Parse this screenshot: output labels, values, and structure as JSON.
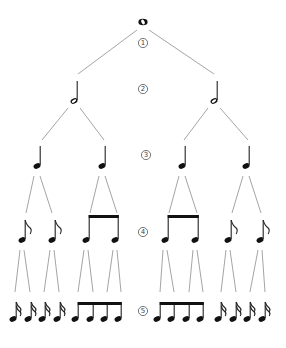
{
  "diagram": {
    "colors": {
      "branch": "#9a9a9a",
      "note": "#111111",
      "label": "#444444"
    },
    "level_labels": [
      {
        "text": "1",
        "x": 143,
        "y": 43
      },
      {
        "text": "2",
        "x": 143,
        "y": 89
      },
      {
        "text": "3",
        "x": 146,
        "y": 155
      },
      {
        "text": "4",
        "x": 143,
        "y": 232
      },
      {
        "text": "5",
        "x": 143,
        "y": 311
      }
    ],
    "levels": [
      {
        "level": 1,
        "name": "whole note",
        "notes": [
          {
            "type": "whole",
            "x": 143,
            "y": 22
          }
        ]
      },
      {
        "level": 2,
        "name": "half notes",
        "notes": [
          {
            "type": "half",
            "x": 74,
            "y": 101
          },
          {
            "type": "half",
            "x": 214,
            "y": 101
          }
        ]
      },
      {
        "level": 3,
        "name": "quarter notes",
        "notes": [
          {
            "type": "quarter",
            "x": 37,
            "y": 166
          },
          {
            "type": "quarter",
            "x": 102,
            "y": 166
          },
          {
            "type": "quarter",
            "x": 182,
            "y": 166
          },
          {
            "type": "quarter",
            "x": 246,
            "y": 166
          }
        ]
      },
      {
        "level": 4,
        "name": "eighth notes",
        "notes": [
          {
            "type": "eighth-flag",
            "x": 22,
            "y": 240
          },
          {
            "type": "eighth-flag",
            "x": 52,
            "y": 240
          },
          {
            "type": "eighth-beam",
            "x": 86,
            "y": 240,
            "group": "b4a"
          },
          {
            "type": "eighth-beam",
            "x": 115,
            "y": 240,
            "group": "b4a"
          },
          {
            "type": "eighth-beam",
            "x": 165,
            "y": 240,
            "group": "b4b"
          },
          {
            "type": "eighth-beam",
            "x": 195,
            "y": 240,
            "group": "b4b"
          },
          {
            "type": "eighth-flag",
            "x": 228,
            "y": 240
          },
          {
            "type": "eighth-flag",
            "x": 260,
            "y": 240
          }
        ]
      },
      {
        "level": 5,
        "name": "sixteenth notes",
        "notes": [
          {
            "type": "sixteenth-flag",
            "x": 13,
            "y": 319
          },
          {
            "type": "sixteenth-flag",
            "x": 28,
            "y": 319
          },
          {
            "type": "sixteenth-flag",
            "x": 42,
            "y": 319
          },
          {
            "type": "sixteenth-flag",
            "x": 57,
            "y": 319
          },
          {
            "type": "beamed",
            "x": 75,
            "y": 319,
            "group": "b5a"
          },
          {
            "type": "beamed",
            "x": 90,
            "y": 319,
            "group": "b5a"
          },
          {
            "type": "beamed",
            "x": 104,
            "y": 319,
            "group": "b5a"
          },
          {
            "type": "beamed",
            "x": 118,
            "y": 319,
            "group": "b5a"
          },
          {
            "type": "beamed",
            "x": 157,
            "y": 319,
            "group": "b5b"
          },
          {
            "type": "beamed",
            "x": 171,
            "y": 319,
            "group": "b5b"
          },
          {
            "type": "beamed",
            "x": 186,
            "y": 319,
            "group": "b5b"
          },
          {
            "type": "beamed",
            "x": 200,
            "y": 319,
            "group": "b5b"
          },
          {
            "type": "sixteenth-flag",
            "x": 218,
            "y": 319
          },
          {
            "type": "sixteenth-flag",
            "x": 233,
            "y": 319
          },
          {
            "type": "sixteenth-flag",
            "x": 247,
            "y": 319
          },
          {
            "type": "sixteenth-flag",
            "x": 262,
            "y": 319
          }
        ]
      }
    ],
    "branches": [
      [
        137,
        30,
        78,
        74
      ],
      [
        149,
        30,
        214,
        74
      ],
      [
        68,
        108,
        42,
        140
      ],
      [
        80,
        108,
        104,
        140
      ],
      [
        208,
        108,
        184,
        140
      ],
      [
        220,
        108,
        248,
        140
      ],
      [
        34,
        176,
        26,
        213
      ],
      [
        40,
        176,
        52,
        213
      ],
      [
        99,
        176,
        90,
        213
      ],
      [
        105,
        176,
        117,
        213
      ],
      [
        179,
        176,
        169,
        213
      ],
      [
        185,
        176,
        197,
        213
      ],
      [
        243,
        176,
        232,
        213
      ],
      [
        249,
        176,
        261,
        213
      ],
      [
        20,
        250,
        15,
        292
      ],
      [
        24,
        250,
        30,
        292
      ],
      [
        50,
        250,
        44,
        292
      ],
      [
        54,
        250,
        59,
        292
      ],
      [
        84,
        250,
        78,
        292
      ],
      [
        88,
        250,
        93,
        292
      ],
      [
        113,
        250,
        107,
        292
      ],
      [
        117,
        250,
        121,
        292
      ],
      [
        163,
        250,
        160,
        292
      ],
      [
        167,
        250,
        174,
        292
      ],
      [
        193,
        250,
        189,
        292
      ],
      [
        197,
        250,
        203,
        292
      ],
      [
        226,
        250,
        221,
        292
      ],
      [
        230,
        250,
        236,
        292
      ],
      [
        258,
        250,
        250,
        292
      ],
      [
        262,
        250,
        265,
        292
      ]
    ]
  }
}
